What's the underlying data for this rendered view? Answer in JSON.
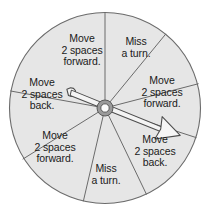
{
  "figure": {
    "name": "spinner-wheel",
    "background_color": "#ffffff",
    "wheel": {
      "fill_color": "#e6e6e6",
      "outline_color": "#6b6b6b",
      "center_x": 105,
      "center_y": 108,
      "radius": 96,
      "segment_count": 8
    },
    "hub": {
      "outer_color": "#8a8a8a",
      "inner_color": "#ffffff",
      "outer_radius": 8,
      "inner_radius": 4
    },
    "pointer": {
      "fill_color": "#f2f2f2",
      "outline_color": "#4d4d4d",
      "angle_degrees": 18,
      "head_label": "arrow-head",
      "tail_label": "arrow-tail"
    }
  },
  "segments": [
    {
      "id": "segment-1",
      "label": "Move\n2 spaces\nforward.",
      "outcome": "Move 2 spaces forward.",
      "position": "upper-left",
      "label_x": 82,
      "label_y": 50
    },
    {
      "id": "segment-2",
      "label": "Miss\na turn.",
      "outcome": "Miss a turn.",
      "position": "upper-right",
      "label_x": 136,
      "label_y": 48
    },
    {
      "id": "segment-3",
      "label": "Move\n2 spaces\nforward.",
      "outcome": "Move 2 spaces forward.",
      "position": "right-upper",
      "label_x": 162,
      "label_y": 92
    },
    {
      "id": "segment-4",
      "label": "Move\n2 spaces\nback.",
      "outcome": "Move 2 spaces back.",
      "position": "right-lower",
      "label_x": 155,
      "label_y": 151
    },
    {
      "id": "segment-5",
      "label": "Miss\na turn.",
      "outcome": "Miss a turn.",
      "position": "bottom",
      "label_x": 106,
      "label_y": 175
    },
    {
      "id": "segment-6",
      "label": "Move\n2 spaces\nforward.",
      "outcome": "Move 2 spaces forward.",
      "position": "lower-left",
      "label_x": 55,
      "label_y": 147
    },
    {
      "id": "segment-7",
      "label": "Move\n2 spaces\nback.",
      "outcome": "Move 2 spaces back.",
      "position": "left",
      "label_x": 42,
      "label_y": 94
    }
  ]
}
